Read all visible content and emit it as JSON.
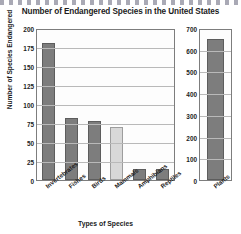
{
  "chart_data": {
    "type": "bar",
    "title": "Number of Endangered Species in the United States",
    "xlabel": "Types of Species",
    "ylabel": "Number of Species Endangered",
    "grid": true,
    "legend": "none",
    "panels": [
      {
        "name": "left-panel",
        "categories": [
          "Invertebrates",
          "Fishes",
          "Birds",
          "Mammals",
          "Amphibians",
          "Reptiles"
        ],
        "values": [
          180,
          82,
          78,
          70,
          15,
          14
        ],
        "colors": [
          "#7d7d7d",
          "#7d7d7d",
          "#7d7d7d",
          "#d8d8d8",
          "#7d7d7d",
          "#7d7d7d"
        ],
        "ylim": [
          0,
          200
        ],
        "yticks": [
          200,
          175,
          150,
          125,
          100,
          75,
          50,
          25,
          0
        ]
      },
      {
        "name": "right-panel",
        "categories": [
          "Plants"
        ],
        "values": [
          650
        ],
        "colors": [
          "#7d7d7d"
        ],
        "ylim": [
          0,
          700
        ],
        "yticks": [
          700,
          600,
          500,
          400,
          300,
          200,
          100,
          0
        ]
      }
    ]
  },
  "style": {
    "bar_dark": "#7d7d7d",
    "bar_light": "#d8d8d8",
    "axis_color": "#7d7d7d",
    "grid_color": "#b9b9b9",
    "background": "#ffffff",
    "text_color": "#1c1c1c"
  }
}
